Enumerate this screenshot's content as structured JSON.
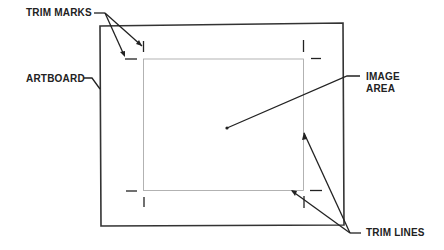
{
  "diagram": {
    "labels": {
      "trim_marks": "TRIM MARKS",
      "artboard": "ARTBOARD",
      "image_area_line1": "IMAGE",
      "image_area_line2": "AREA",
      "trim_lines": "TRIM LINES"
    },
    "colors": {
      "ink": "#222222",
      "trim_line": "#9a9a9a",
      "background": "#ffffff"
    }
  }
}
